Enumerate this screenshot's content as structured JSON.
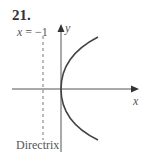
{
  "problem": {
    "number": "21."
  },
  "labels": {
    "directrix_equation_var": "x",
    "directrix_equation_rest": " = −1",
    "y_axis": "y",
    "x_axis": "x",
    "directrix": "Directrix"
  },
  "colors": {
    "axis": "#555555",
    "curve": "#444444",
    "directrix": "#777777"
  }
}
